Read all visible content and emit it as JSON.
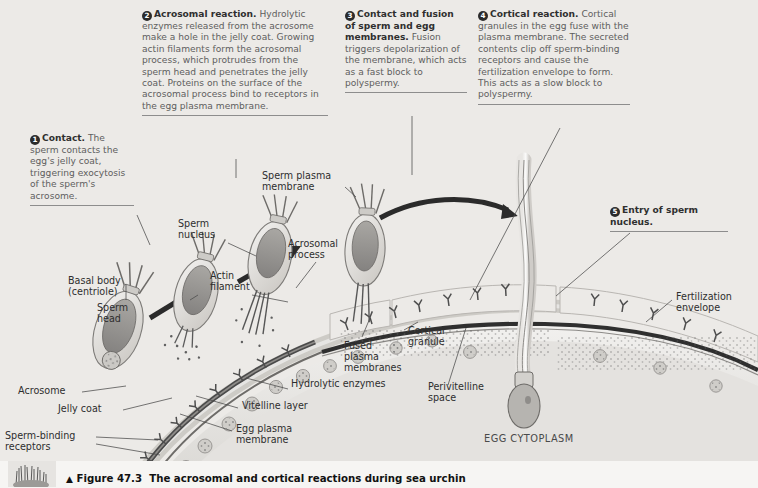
{
  "figure": {
    "triangle": "▲",
    "number": "Figure 47.3",
    "title": "The acrosomal and cortical reactions during sea urchin"
  },
  "callouts": [
    {
      "num": "1",
      "title": "Contact.",
      "body": " The sperm contacts the egg's jelly coat, triggering exocytosis of the sperm's acrosome."
    },
    {
      "num": "2",
      "title": "Acrosomal reaction.",
      "body": " Hydrolytic enzymes released from the acrosome make a hole in the jelly coat. Growing actin filaments form the acrosomal process, which protrudes from the sperm head and penetrates the jelly coat. Proteins on the surface of the acrosomal process bind to receptors in the egg plasma membrane."
    },
    {
      "num": "3",
      "title": "Contact and fusion of sperm and egg membranes.",
      "body": " Fusion triggers depolarization of the membrane, which acts as a fast block to polyspermy."
    },
    {
      "num": "4",
      "title": "Cortical reaction.",
      "body": " Cortical granules in the egg fuse with the plasma membrane. The secreted contents clip off sperm-binding receptors and cause the fertilization envelope to form. This acts as a slow block to polyspermy."
    },
    {
      "num": "5",
      "title": "Entry of sperm nucleus.",
      "body": ""
    }
  ],
  "labels": {
    "basal_body": "Basal body\n(centriole)",
    "sperm_head": "Sperm\nhead",
    "acrosome": "Acrosome",
    "jelly_coat": "Jelly coat",
    "sperm_binding_receptors": "Sperm-binding\nreceptors",
    "sperm_nucleus": "Sperm\nnucleus",
    "actin_filament": "Actin\nfilament",
    "sperm_plasma_membrane": "Sperm plasma\nmembrane",
    "acrosomal_process": "Acrosomal\nprocess",
    "hydrolytic_enzymes": "Hydrolytic enzymes",
    "vitelline_layer": "Vitelline layer",
    "egg_plasma_membrane": "Egg plasma\nmembrane",
    "fused_plasma_membranes": "Fused\nplasma\nmembranes",
    "cortical_granule": "Cortical\ngranule",
    "perivitelline_space": "Perivitelline\nspace",
    "fertilization_envelope": "Fertilization\nenvelope",
    "egg_cytoplasm": "EGG CYTOPLASM"
  },
  "colors": {
    "background": "#eceae7",
    "ink": "#2e2e2e",
    "body_text": "#5e5e5e",
    "membrane": "#3a3a3a",
    "nucleus_fill": "#9a9a9a",
    "cell_fill": "#dcdad6"
  }
}
